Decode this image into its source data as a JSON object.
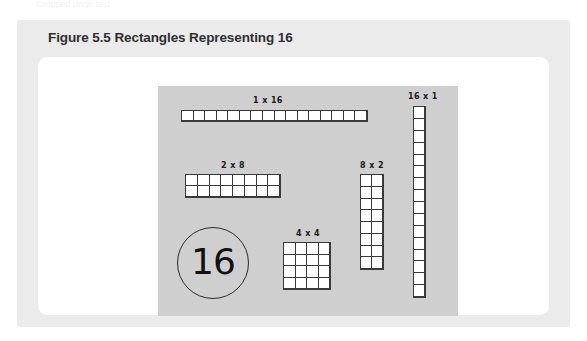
{
  "page": {
    "top_text_remnant": "Cropped page text"
  },
  "figure": {
    "caption": "Figure 5.5 Rectangles Representing 16",
    "background_color": "#ebebeb",
    "card_color": "#ffffff",
    "plate_color": "#cfcfcf"
  },
  "diagram": {
    "number_circle": {
      "value": "16"
    },
    "arrangements": [
      {
        "label": "1 x 16",
        "rows": 1,
        "cols": 16
      },
      {
        "label": "2 x 8",
        "rows": 2,
        "cols": 8
      },
      {
        "label": "4 x 4",
        "rows": 4,
        "cols": 4
      },
      {
        "label": "8 x 2",
        "rows": 8,
        "cols": 2
      },
      {
        "label": "16 x 1",
        "rows": 16,
        "cols": 1
      }
    ]
  }
}
